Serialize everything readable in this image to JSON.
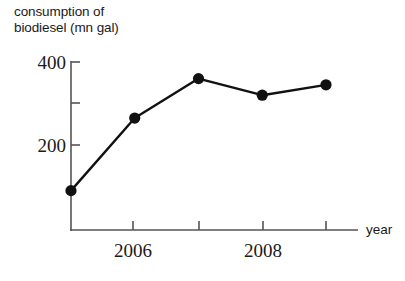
{
  "chart_data": {
    "type": "line",
    "title": "consumption of biodiesel (mn gal)",
    "title_line1": "consumption of",
    "title_line2": "biodiesel (mn gal)",
    "xlabel": "year",
    "ylabel": "consumption of biodiesel (mn gal)",
    "x": [
      2005,
      2006,
      2007,
      2008,
      2009
    ],
    "values": [
      90,
      265,
      360,
      320,
      345
    ],
    "categories": [
      "2005",
      "2006",
      "2007",
      "2008",
      "2009"
    ],
    "xlim": [
      2004.8,
      2009.6
    ],
    "ylim": [
      0,
      420
    ],
    "yticks": [
      200,
      300,
      400
    ],
    "ytick_labels": [
      "200",
      "",
      "400"
    ],
    "ytick_labels_shown": [
      "200",
      "400"
    ],
    "xticks": [
      2006,
      2007,
      2008,
      2009
    ],
    "xtick_labels_shown": [
      "2006",
      "2008"
    ],
    "grid": false,
    "legend": false,
    "marker": "filled-circle",
    "line_color": "#111111",
    "marker_color": "#111111",
    "axis_color": "#555555"
  },
  "axes": {
    "y_tick_400": "400",
    "y_tick_200": "200",
    "x_tick_2006": "2006",
    "x_tick_2008": "2008",
    "x_axis_name": "year"
  }
}
